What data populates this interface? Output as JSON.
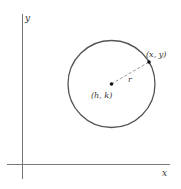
{
  "diagram": {
    "axes": {
      "x_label": "x",
      "y_label": "y"
    },
    "circle": {
      "center_label": "(h, k)",
      "point_label": "(x, y)",
      "radius_label": "r"
    },
    "colors": {
      "stroke": "#555555",
      "axis": "#777777",
      "dashed": "#999999",
      "text": "#333333"
    }
  }
}
